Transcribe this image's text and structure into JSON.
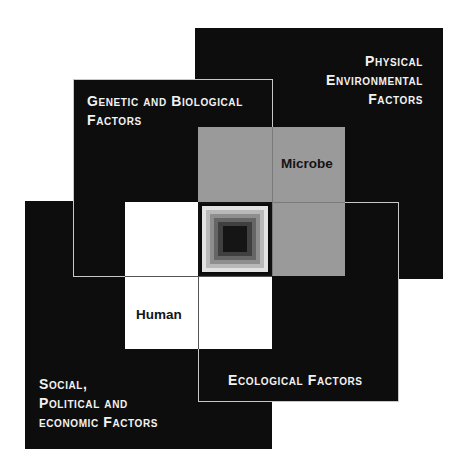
{
  "diagram": {
    "boxes": {
      "physical": {
        "lines": [
          "Physical",
          "Environmental",
          "Factors"
        ]
      },
      "genetic": {
        "lines": [
          "Genetic and Biological",
          "Factors"
        ]
      },
      "social": {
        "lines": [
          "Social,",
          "Political and",
          "economic Factors"
        ]
      },
      "ecological": {
        "lines": [
          "Ecological Factors"
        ]
      }
    },
    "cells": {
      "microbe": "Microbe",
      "human": "Human"
    },
    "colors": {
      "box_fill": "#0d0d0d",
      "box_border": "#c8c8c8",
      "microbe_fill": "#9a9a9a",
      "human_fill": "#ffffff",
      "label_text": "#f2f2f2"
    }
  }
}
